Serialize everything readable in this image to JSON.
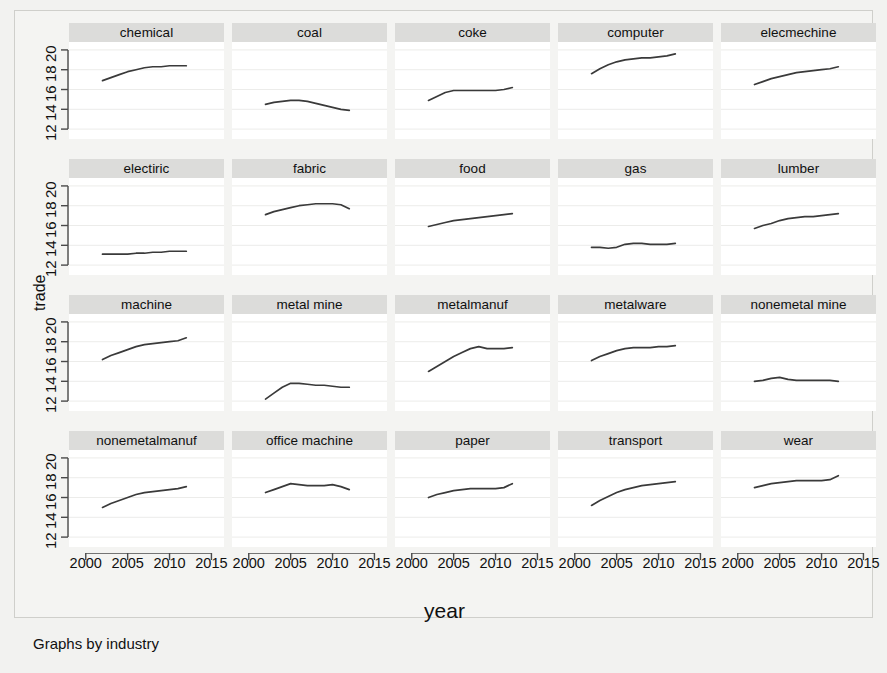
{
  "figure": {
    "xlabel": "year",
    "ylabel": "trade",
    "note": "Graphs by industry"
  },
  "chart_data": {
    "type": "line",
    "title": "",
    "subtitle": "",
    "xlabel": "year",
    "ylabel": "trade",
    "note": "Graphs by industry",
    "layout": {
      "rows": 4,
      "cols": 5,
      "small_multiples_by": "industry",
      "grid": true,
      "legend": "none"
    },
    "xlim": [
      1998.0,
      2016.5
    ],
    "ylim": [
      11.0,
      20.8
    ],
    "xticks": [
      2000,
      2005,
      2010,
      2015
    ],
    "yticks": [
      12,
      14,
      16,
      18,
      20
    ],
    "x": [
      2002,
      2003,
      2004,
      2005,
      2006,
      2007,
      2008,
      2009,
      2010,
      2011,
      2012
    ],
    "series": [
      {
        "name": "chemical",
        "values": [
          16.9,
          17.2,
          17.5,
          17.8,
          18.0,
          18.2,
          18.3,
          18.3,
          18.4,
          18.4,
          18.4
        ]
      },
      {
        "name": "coal",
        "values": [
          14.5,
          14.7,
          14.8,
          14.9,
          14.9,
          14.8,
          14.6,
          14.4,
          14.2,
          14.0,
          13.9
        ]
      },
      {
        "name": "coke",
        "values": [
          14.9,
          15.3,
          15.7,
          15.9,
          15.9,
          15.9,
          15.9,
          15.9,
          15.9,
          16.0,
          16.2
        ]
      },
      {
        "name": "computer",
        "values": [
          17.6,
          18.1,
          18.5,
          18.8,
          19.0,
          19.1,
          19.2,
          19.2,
          19.3,
          19.4,
          19.6
        ]
      },
      {
        "name": "elecmechine",
        "values": [
          16.5,
          16.8,
          17.1,
          17.3,
          17.5,
          17.7,
          17.8,
          17.9,
          18.0,
          18.1,
          18.3
        ]
      },
      {
        "name": "electiric",
        "values": [
          13.1,
          13.1,
          13.1,
          13.1,
          13.2,
          13.2,
          13.3,
          13.3,
          13.4,
          13.4,
          13.4
        ]
      },
      {
        "name": "fabric",
        "values": [
          17.1,
          17.4,
          17.6,
          17.8,
          18.0,
          18.1,
          18.2,
          18.2,
          18.2,
          18.1,
          17.7
        ]
      },
      {
        "name": "food",
        "values": [
          15.9,
          16.1,
          16.3,
          16.5,
          16.6,
          16.7,
          16.8,
          16.9,
          17.0,
          17.1,
          17.2
        ]
      },
      {
        "name": "gas",
        "values": [
          13.8,
          13.8,
          13.7,
          13.8,
          14.1,
          14.2,
          14.2,
          14.1,
          14.1,
          14.1,
          14.2
        ]
      },
      {
        "name": "lumber",
        "values": [
          15.7,
          16.0,
          16.2,
          16.5,
          16.7,
          16.8,
          16.9,
          16.9,
          17.0,
          17.1,
          17.2
        ]
      },
      {
        "name": "machine",
        "values": [
          16.2,
          16.6,
          16.9,
          17.2,
          17.5,
          17.7,
          17.8,
          17.9,
          18.0,
          18.1,
          18.4
        ]
      },
      {
        "name": "metal mine",
        "values": [
          12.2,
          12.8,
          13.4,
          13.8,
          13.8,
          13.7,
          13.6,
          13.6,
          13.5,
          13.4,
          13.4
        ]
      },
      {
        "name": "metalmanuf",
        "values": [
          15.0,
          15.5,
          16.0,
          16.5,
          16.9,
          17.3,
          17.5,
          17.3,
          17.3,
          17.3,
          17.4
        ]
      },
      {
        "name": "metalware",
        "values": [
          16.1,
          16.5,
          16.8,
          17.1,
          17.3,
          17.4,
          17.4,
          17.4,
          17.5,
          17.5,
          17.6
        ]
      },
      {
        "name": "nonemetal mine",
        "values": [
          14.0,
          14.1,
          14.3,
          14.4,
          14.2,
          14.1,
          14.1,
          14.1,
          14.1,
          14.1,
          14.0
        ]
      },
      {
        "name": "nonemetalmanuf",
        "values": [
          15.0,
          15.4,
          15.7,
          16.0,
          16.3,
          16.5,
          16.6,
          16.7,
          16.8,
          16.9,
          17.1
        ]
      },
      {
        "name": "office machine",
        "values": [
          16.5,
          16.8,
          17.1,
          17.4,
          17.3,
          17.2,
          17.2,
          17.2,
          17.3,
          17.1,
          16.8
        ]
      },
      {
        "name": "paper",
        "values": [
          16.0,
          16.3,
          16.5,
          16.7,
          16.8,
          16.9,
          16.9,
          16.9,
          16.9,
          17.0,
          17.4
        ]
      },
      {
        "name": "transport",
        "values": [
          15.2,
          15.7,
          16.1,
          16.5,
          16.8,
          17.0,
          17.2,
          17.3,
          17.4,
          17.5,
          17.6
        ]
      },
      {
        "name": "wear",
        "values": [
          17.0,
          17.2,
          17.4,
          17.5,
          17.6,
          17.7,
          17.7,
          17.7,
          17.7,
          17.8,
          18.2
        ]
      }
    ]
  }
}
